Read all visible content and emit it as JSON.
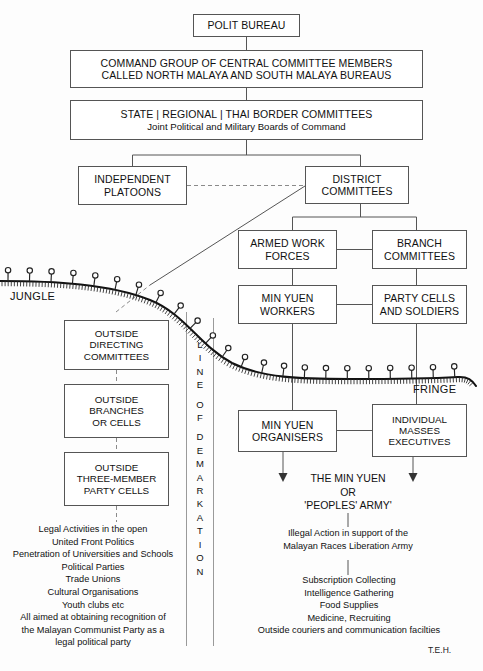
{
  "diagram": {
    "signature": "T.E.H.",
    "labels": {
      "jungle": "JUNGLE",
      "fringe": "FRINGE",
      "demarcation": "LINE OF DEMARKATION"
    },
    "boxes": {
      "polit_bureau": "POLIT BUREAU",
      "command_group_line1": "COMMAND GROUP OF CENTRAL COMMITTEE MEMBERS",
      "command_group_line2": "CALLED NORTH MALAYA AND SOUTH MALAYA BUREAUS",
      "state_committees_line1": "STATE | REGIONAL | THAI BORDER COMMITTEES",
      "state_committees_line2": "Joint Political and Military Boards of Command",
      "independent_platoons_line1": "INDEPENDENT",
      "independent_platoons_line2": "PLATOONS",
      "district_committees_line1": "DISTRICT",
      "district_committees_line2": "COMMITTEES",
      "armed_work_forces_line1": "ARMED WORK",
      "armed_work_forces_line2": "FORCES",
      "branch_committees_line1": "BRANCH",
      "branch_committees_line2": "COMMITTEES",
      "min_yuen_workers_line1": "MIN YUEN",
      "min_yuen_workers_line2": "WORKERS",
      "party_cells_line1": "PARTY CELLS",
      "party_cells_line2": "AND SOLDIERS",
      "outside_directing_line1": "OUTSIDE",
      "outside_directing_line2": "DIRECTING",
      "outside_directing_line3": "COMMITTEES",
      "outside_branches_line1": "OUTSIDE",
      "outside_branches_line2": "BRANCHES",
      "outside_branches_line3": "OR CELLS",
      "outside_three_member_line1": "OUTSIDE",
      "outside_three_member_line2": "THREE-MEMBER",
      "outside_three_member_line3": "PARTY CELLS",
      "min_yuen_organisers_line1": "MIN YUEN",
      "min_yuen_organisers_line2": "ORGANISERS",
      "individual_masses_line1": "INDIVIDUAL",
      "individual_masses_line2": "MASSES",
      "individual_masses_line3": "EXECUTIVES"
    },
    "left_column_text": {
      "heading_lines": [
        "Legal Activities in the open",
        "United Front Politics",
        "Penetration of Universities and Schools",
        "Political Parties",
        "Trade Unions",
        "Cultural Organisations",
        "Youth clubs etc",
        "All aimed at obtaining recognition of",
        "the Malayan Communist Party as a",
        "legal political party"
      ]
    },
    "right_column_text": {
      "min_yuen_line1": "THE MIN YUEN",
      "min_yuen_line2": "OR",
      "min_yuen_line3": "'PEOPLES' ARMY'",
      "illegal_action_line1": "Illegal Action in support of the",
      "illegal_action_line2": "Malayan Races Liberation Army",
      "activity_lines": [
        "Subscription Collecting",
        "Intelligence Gathering",
        "Food Supplies",
        "Medicine, Recruiting",
        "Outside couriers and communication facilties"
      ]
    },
    "colors": {
      "line": "#555555",
      "text": "#111111",
      "background": "#fdfdfd",
      "dashed": "#8a8a8a"
    }
  }
}
